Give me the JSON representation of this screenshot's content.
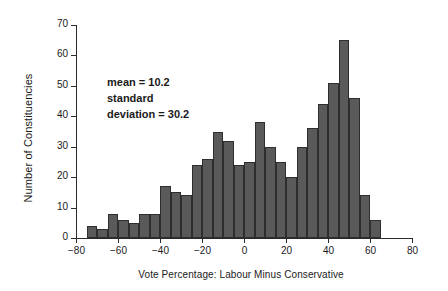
{
  "chart_data": {
    "type": "bar",
    "title": "",
    "xlabel": "Vote Percentage: Labour Minus Conservative",
    "ylabel": "Number of Constituencies",
    "xlim": [
      -80,
      80
    ],
    "ylim": [
      0,
      70
    ],
    "xticks": [
      -80,
      -60,
      -40,
      -20,
      0,
      20,
      40,
      60,
      80
    ],
    "yticks": [
      0,
      10,
      20,
      30,
      40,
      50,
      60,
      70
    ],
    "grid": false,
    "legend": null,
    "bin_width": 5,
    "bin_starts": [
      -75,
      -70,
      -65,
      -60,
      -55,
      -50,
      -45,
      -40,
      -35,
      -30,
      -25,
      -20,
      -15,
      -10,
      -5,
      0,
      5,
      10,
      15,
      20,
      25,
      30,
      35,
      40,
      45,
      50,
      55,
      60
    ],
    "categories": [
      "-75 to -70",
      "-70 to -65",
      "-65 to -60",
      "-60 to -55",
      "-55 to -50",
      "-50 to -45",
      "-45 to -40",
      "-40 to -35",
      "-35 to -30",
      "-30 to -25",
      "-25 to -20",
      "-20 to -15",
      "-15 to -10",
      "-10 to -5",
      "-5 to 0",
      "0 to 5",
      "5 to 10",
      "10 to 15",
      "15 to 20",
      "20 to 25",
      "25 to 30",
      "30 to 35",
      "35 to 40",
      "40 to 45",
      "45 to 50",
      "50 to 55",
      "55 to 60",
      "60 to 65"
    ],
    "values": [
      4,
      3,
      8,
      6,
      5,
      8,
      8,
      17,
      15,
      14,
      24,
      26,
      35,
      32,
      24,
      25,
      38,
      30,
      25,
      20,
      30,
      36,
      44,
      51,
      65,
      46,
      14,
      6
    ],
    "annotations": {
      "line1": "mean = 10.2",
      "line2": "standard",
      "line3": "deviation = 30.2"
    }
  }
}
